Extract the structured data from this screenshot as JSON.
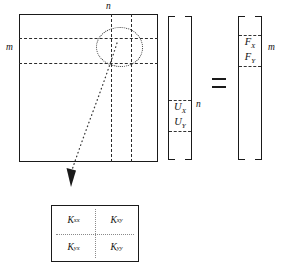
{
  "figure": {
    "equals_symbol": "="
  },
  "matrix": {
    "name": "stiffness-matrix",
    "top_label": "n",
    "left_label": "m"
  },
  "vector_u": {
    "name": "displacement-vector",
    "entries": [
      {
        "symbol": "U",
        "subscript": "X"
      },
      {
        "symbol": "U",
        "subscript": "Y"
      }
    ],
    "size_label": "n"
  },
  "vector_f": {
    "name": "force-vector",
    "entries": [
      {
        "symbol": "F",
        "subscript": "X"
      },
      {
        "symbol": "F",
        "subscript": "Y"
      }
    ],
    "size_label": "m"
  },
  "sub_block": {
    "name": "k-submatrix",
    "cells": [
      {
        "symbol": "K",
        "subscript": "xx"
      },
      {
        "symbol": "K",
        "subscript": "xy"
      },
      {
        "symbol": "K",
        "subscript": "yx"
      },
      {
        "symbol": "K",
        "subscript": "yy"
      }
    ]
  },
  "annotations": {
    "highlight_shape": "dotted-ellipse",
    "callout": "dotted-arrow"
  }
}
